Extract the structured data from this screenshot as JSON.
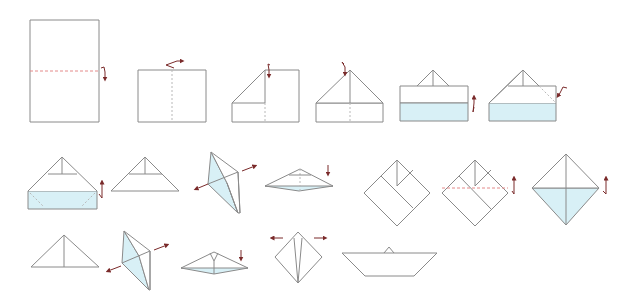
{
  "diagram": {
    "title": "",
    "colors": {
      "paper_edge": "#8a8a8a",
      "paper_fill": "#ffffff",
      "colored_side": "#d8f0f6",
      "valley_fold_line": "#e48a8a",
      "arrow": "#7a2a2a"
    },
    "rows": [
      {
        "steps": [
          {
            "id": 1,
            "shape": "rectangle-portrait",
            "marks": [
              "horizontal valley fold (dashed red)",
              "fold-down arrow"
            ]
          },
          {
            "id": 2,
            "shape": "rectangle-landscape",
            "marks": [
              "vertical crease (dashed)",
              "fold-over arrow at top"
            ]
          },
          {
            "id": 3,
            "shape": "rectangle-with-left-corner-folded",
            "marks": [
              "vertical crease (dashed)",
              "fold-down arrow at top center"
            ]
          },
          {
            "id": 4,
            "shape": "house-shape (both corners folded)",
            "marks": [
              "vertical crease (dashed)",
              "fold arrow at apex"
            ]
          },
          {
            "id": 5,
            "shape": "house-shape with colored bottom strip folded up",
            "marks": [
              "fold-up arrow on right"
            ]
          },
          {
            "id": 6,
            "shape": "house-shape, bottom flap folding",
            "marks": [
              "hidden line (dashed)",
              "fold arrow at right"
            ]
          }
        ]
      },
      {
        "steps": [
          {
            "id": 7,
            "shape": "hat with colored brim",
            "marks": [
              "hidden lines inside brim",
              "fold-up arrow on right"
            ]
          },
          {
            "id": 8,
            "shape": "paper hat (triangle)",
            "marks": []
          },
          {
            "id": 9,
            "shape": "hat opening in 3D",
            "marks": [
              "pull-apart arrows"
            ]
          },
          {
            "id": 10,
            "shape": "flattened rhombus",
            "marks": [
              "press-down arrow"
            ]
          },
          {
            "id": 11,
            "shape": "square diamond",
            "marks": []
          },
          {
            "id": 12,
            "shape": "square diamond",
            "marks": [
              "horizontal valley fold (dashed red)",
              "fold-up arrow"
            ]
          },
          {
            "id": 13,
            "shape": "square diamond with colored lower half",
            "marks": [
              "fold-up arrow"
            ]
          }
        ]
      },
      {
        "steps": [
          {
            "id": 14,
            "shape": "triangle",
            "marks": []
          },
          {
            "id": 15,
            "shape": "triangle opening in 3D",
            "marks": [
              "pull-apart arrows"
            ]
          },
          {
            "id": 16,
            "shape": "flattened rhombus",
            "marks": [
              "press-down arrow"
            ]
          },
          {
            "id": 17,
            "shape": "diamond",
            "marks": [
              "pull-outward arrows left and right"
            ]
          },
          {
            "id": 18,
            "shape": "finished paper boat",
            "marks": []
          }
        ]
      }
    ]
  }
}
